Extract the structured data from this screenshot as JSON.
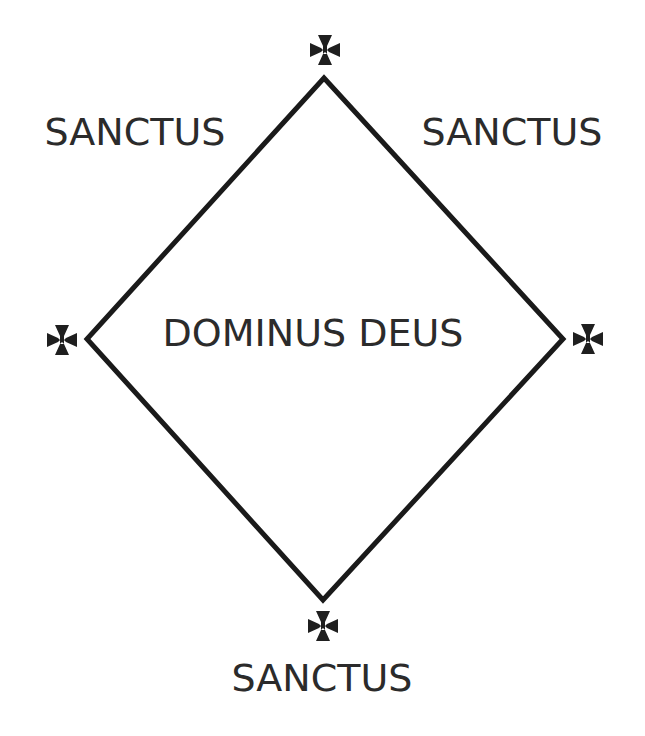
{
  "diagram": {
    "type": "diamond",
    "colors": {
      "background": "#ffffff",
      "stroke": "#1a1a1a",
      "text": "#2b2b2b"
    },
    "stroke_width": 5,
    "vertices": {
      "top": [
        324,
        78
      ],
      "right": [
        563,
        339
      ],
      "bottom": [
        323,
        600
      ],
      "left": [
        87,
        339
      ]
    },
    "center_label": "DOMINUS DEUS",
    "labels": {
      "top_left": "SANCTUS",
      "top_right": "SANCTUS",
      "bottom": "SANCTUS"
    },
    "crosses": [
      {
        "position": "top",
        "icon": "cross-pattee-icon"
      },
      {
        "position": "left",
        "icon": "cross-pattee-icon"
      },
      {
        "position": "right",
        "icon": "cross-pattee-icon"
      },
      {
        "position": "bottom",
        "icon": "cross-pattee-icon"
      }
    ]
  }
}
